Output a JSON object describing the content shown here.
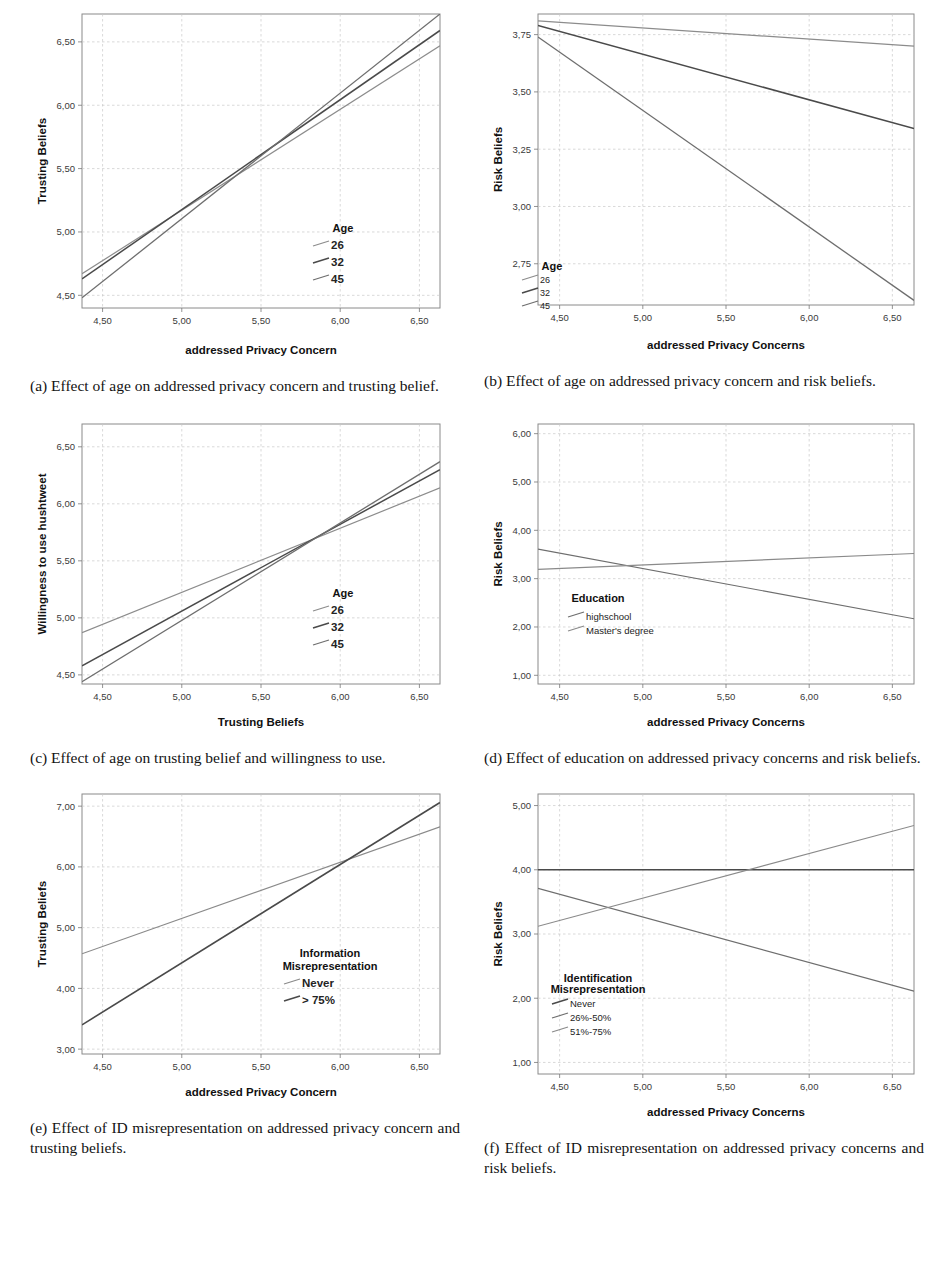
{
  "figure": {
    "subfigures": [
      {
        "key": "a",
        "caption": "(a) Effect of age on addressed privacy concern and trusting belief.",
        "chart_data": {
          "type": "line",
          "title": "",
          "xlabel": "addressed Privacy Concern",
          "ylabel": "Trusting Beliefs",
          "xlim": [
            4.37,
            6.63
          ],
          "ylim": [
            4.4,
            6.72
          ],
          "xticks": [
            "4,50",
            "5,00",
            "5,50",
            "6,00",
            "6,50"
          ],
          "xtickvals": [
            4.5,
            5.0,
            5.5,
            6.0,
            6.5
          ],
          "yticks": [
            "4,50",
            "5,00",
            "5,50",
            "6,00",
            "6,50"
          ],
          "ytickvals": [
            4.5,
            5.0,
            5.5,
            6.0,
            6.5
          ],
          "grid": true,
          "legend_title": "Age",
          "legend_position": "inside-right-lower",
          "series": [
            {
              "name": "26",
              "color": "#8c8c8c",
              "width": 1.2,
              "x": [
                4.37,
                6.63
              ],
              "y": [
                4.67,
                6.47
              ]
            },
            {
              "name": "32",
              "color": "#4a4a4a",
              "width": 1.5,
              "x": [
                4.37,
                6.63
              ],
              "y": [
                4.63,
                6.59
              ]
            },
            {
              "name": "45",
              "color": "#6e6e6e",
              "width": 1.3,
              "x": [
                4.37,
                6.63
              ],
              "y": [
                4.48,
                6.72
              ]
            }
          ]
        }
      },
      {
        "key": "b",
        "caption": "(b) Effect of age on addressed privacy concern and risk beliefs.",
        "chart_data": {
          "type": "line",
          "title": "",
          "xlabel": "addressed Privacy Concerns",
          "ylabel": "Risk Beliefs",
          "xlim": [
            4.37,
            6.63
          ],
          "ylim": [
            2.57,
            3.84
          ],
          "xticks": [
            "4,50",
            "5,00",
            "5,50",
            "6,00",
            "6,50"
          ],
          "xtickvals": [
            4.5,
            5.0,
            5.5,
            6.0,
            6.5
          ],
          "yticks": [
            "2,75",
            "3,00",
            "3,25",
            "3,50",
            "3,75"
          ],
          "ytickvals": [
            2.75,
            3.0,
            3.25,
            3.5,
            3.75
          ],
          "grid": true,
          "legend_title": "Age",
          "legend_position": "inside-left-lower",
          "series": [
            {
              "name": "26",
              "color": "#8c8c8c",
              "width": 1.2,
              "x": [
                4.37,
                6.63
              ],
              "y": [
                3.81,
                3.7
              ]
            },
            {
              "name": "32",
              "color": "#4a4a4a",
              "width": 1.5,
              "x": [
                4.37,
                6.63
              ],
              "y": [
                3.79,
                3.34
              ]
            },
            {
              "name": "45",
              "color": "#6e6e6e",
              "width": 1.3,
              "x": [
                4.37,
                6.63
              ],
              "y": [
                3.74,
                2.59
              ]
            }
          ]
        }
      },
      {
        "key": "c",
        "caption": "(c) Effect of age on trusting belief and willingness to use.",
        "chart_data": {
          "type": "line",
          "title": "",
          "xlabel": "Trusting Beliefs",
          "ylabel": "Willingness to use hushtweet",
          "xlim": [
            4.37,
            6.63
          ],
          "ylim": [
            4.42,
            6.7
          ],
          "xticks": [
            "4,50",
            "5,00",
            "5,50",
            "6,00",
            "6,50"
          ],
          "xtickvals": [
            4.5,
            5.0,
            5.5,
            6.0,
            6.5
          ],
          "yticks": [
            "4,50",
            "5,00",
            "5,50",
            "6,00",
            "6,50"
          ],
          "ytickvals": [
            4.5,
            5.0,
            5.5,
            6.0,
            6.5
          ],
          "grid": true,
          "legend_title": "Age",
          "legend_position": "inside-right-lower",
          "series": [
            {
              "name": "26",
              "color": "#8c8c8c",
              "width": 1.2,
              "x": [
                4.37,
                6.63
              ],
              "y": [
                4.87,
                6.14
              ]
            },
            {
              "name": "32",
              "color": "#4a4a4a",
              "width": 1.5,
              "x": [
                4.37,
                6.63
              ],
              "y": [
                4.58,
                6.3
              ]
            },
            {
              "name": "45",
              "color": "#6e6e6e",
              "width": 1.3,
              "x": [
                4.37,
                6.63
              ],
              "y": [
                4.44,
                6.37
              ]
            }
          ]
        }
      },
      {
        "key": "d",
        "caption": "(d) Effect of education on addressed privacy concerns and risk beliefs.",
        "chart_data": {
          "type": "line",
          "title": "",
          "xlabel": "addressed Privacy Concerns",
          "ylabel": "Risk Beliefs",
          "xlim": [
            4.37,
            6.63
          ],
          "ylim": [
            0.82,
            6.2
          ],
          "xticks": [
            "4,50",
            "5,00",
            "5,50",
            "6,00",
            "6,50"
          ],
          "xtickvals": [
            4.5,
            5.0,
            5.5,
            6.0,
            6.5
          ],
          "yticks": [
            "1,00",
            "2,00",
            "3,00",
            "4,00",
            "5,00",
            "6,00"
          ],
          "ytickvals": [
            1.0,
            2.0,
            3.0,
            4.0,
            5.0,
            6.0
          ],
          "grid": true,
          "legend_title": "Education",
          "legend_position": "inside-left-lower",
          "series": [
            {
              "name": "highschool",
              "color": "#6e6e6e",
              "width": 1.2,
              "x": [
                4.37,
                6.63
              ],
              "y": [
                3.61,
                2.17
              ]
            },
            {
              "name": "Master's degree",
              "color": "#8a8a8a",
              "width": 1.2,
              "x": [
                4.37,
                6.63
              ],
              "y": [
                3.19,
                3.52
              ]
            }
          ]
        }
      },
      {
        "key": "e",
        "caption": "(e) Effect of ID misrepresentation on addressed privacy concern and trusting beliefs.",
        "chart_data": {
          "type": "line",
          "title": "",
          "xlabel": "addressed Privacy Concern",
          "ylabel": "Trusting Beliefs",
          "xlim": [
            4.37,
            6.63
          ],
          "ylim": [
            2.92,
            7.2
          ],
          "xticks": [
            "4,50",
            "5,00",
            "5,50",
            "6,00",
            "6,50"
          ],
          "xtickvals": [
            4.5,
            5.0,
            5.5,
            6.0,
            6.5
          ],
          "yticks": [
            "3,00",
            "4,00",
            "5,00",
            "6,00",
            "7,00"
          ],
          "ytickvals": [
            3.0,
            4.0,
            5.0,
            6.0,
            7.0
          ],
          "grid": true,
          "legend_title_line1": "Information",
          "legend_title_line2": "Misrepresentation",
          "legend_position": "inside-right-lower",
          "series": [
            {
              "name": "Never",
              "color": "#8a8a8a",
              "width": 1.2,
              "x": [
                4.37,
                6.63
              ],
              "y": [
                4.57,
                6.66
              ]
            },
            {
              "name": "> 75%",
              "color": "#4a4a4a",
              "width": 1.6,
              "x": [
                4.37,
                6.63
              ],
              "y": [
                3.4,
                7.06
              ]
            }
          ]
        }
      },
      {
        "key": "f",
        "caption": "(f) Effect of ID misrepresentation on addressed privacy concerns and risk beliefs.",
        "chart_data": {
          "type": "line",
          "title": "",
          "xlabel": "addressed Privacy Concerns",
          "ylabel": "Risk Beliefs",
          "xlim": [
            4.37,
            6.63
          ],
          "ylim": [
            0.82,
            5.18
          ],
          "xticks": [
            "4,50",
            "5,00",
            "5,50",
            "6,00",
            "6,50"
          ],
          "xtickvals": [
            4.5,
            5.0,
            5.5,
            6.0,
            6.5
          ],
          "yticks": [
            "1,00",
            "2,00",
            "3,00",
            "4,00",
            "5,00"
          ],
          "ytickvals": [
            1.0,
            2.0,
            3.0,
            4.0,
            5.0
          ],
          "grid": true,
          "legend_title_line1": "Identification",
          "legend_title_line2": "Misrepresentation",
          "legend_position": "inside-left-lower",
          "series": [
            {
              "name": "Never",
              "color": "#4a4a4a",
              "width": 1.5,
              "x": [
                4.37,
                6.63
              ],
              "y": [
                4.0,
                4.0
              ]
            },
            {
              "name": "26%-50%",
              "color": "#6e6e6e",
              "width": 1.2,
              "x": [
                4.37,
                6.63
              ],
              "y": [
                3.71,
                2.11
              ]
            },
            {
              "name": "51%-75%",
              "color": "#8a8a8a",
              "width": 1.2,
              "x": [
                4.37,
                6.63
              ],
              "y": [
                3.12,
                4.69
              ]
            }
          ]
        }
      }
    ]
  }
}
